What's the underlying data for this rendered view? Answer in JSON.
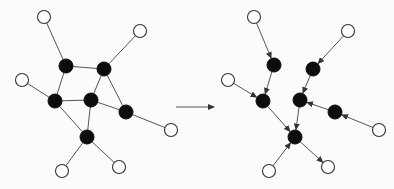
{
  "figure": {
    "colors": {
      "background": "#fbfbfb",
      "edge": "#555555",
      "internal_node": "#0d0d0d",
      "leaf_node_fill": "#ffffff",
      "leaf_node_stroke": "#333333"
    },
    "node_radius": {
      "internal": 7,
      "leaf": 6.5
    }
  },
  "left_graph": {
    "type": "undirected",
    "nodes": [
      {
        "id": "w_tl",
        "kind": "leaf",
        "x": 44,
        "y": 17
      },
      {
        "id": "w_tr",
        "kind": "leaf",
        "x": 140,
        "y": 31
      },
      {
        "id": "w_l",
        "kind": "leaf",
        "x": 22,
        "y": 80
      },
      {
        "id": "w_r",
        "kind": "leaf",
        "x": 171,
        "y": 130
      },
      {
        "id": "w_bl",
        "kind": "leaf",
        "x": 62,
        "y": 171
      },
      {
        "id": "w_br",
        "kind": "leaf",
        "x": 119,
        "y": 167
      },
      {
        "id": "A",
        "kind": "internal",
        "x": 66,
        "y": 66
      },
      {
        "id": "B",
        "kind": "internal",
        "x": 104,
        "y": 69
      },
      {
        "id": "C",
        "kind": "internal",
        "x": 55,
        "y": 101
      },
      {
        "id": "D",
        "kind": "internal",
        "x": 91,
        "y": 100
      },
      {
        "id": "E",
        "kind": "internal",
        "x": 126,
        "y": 112
      },
      {
        "id": "F",
        "kind": "internal",
        "x": 87,
        "y": 137
      }
    ],
    "edges": [
      [
        "w_tl",
        "A"
      ],
      [
        "A",
        "B"
      ],
      [
        "A",
        "C"
      ],
      [
        "B",
        "w_tr"
      ],
      [
        "B",
        "D"
      ],
      [
        "B",
        "E"
      ],
      [
        "C",
        "w_l"
      ],
      [
        "C",
        "D"
      ],
      [
        "C",
        "F"
      ],
      [
        "D",
        "E"
      ],
      [
        "D",
        "F"
      ],
      [
        "E",
        "w_r"
      ],
      [
        "F",
        "w_bl"
      ],
      [
        "F",
        "w_br"
      ]
    ]
  },
  "transform_arrow": {
    "x1": 176,
    "y1": 107,
    "x2": 214,
    "y2": 107
  },
  "right_graph": {
    "type": "directed",
    "nodes": [
      {
        "id": "w_tl",
        "kind": "leaf",
        "x": 254,
        "y": 17
      },
      {
        "id": "w_tr",
        "kind": "leaf",
        "x": 348,
        "y": 31
      },
      {
        "id": "w_l",
        "kind": "leaf",
        "x": 228,
        "y": 80
      },
      {
        "id": "w_r",
        "kind": "leaf",
        "x": 379,
        "y": 130
      },
      {
        "id": "w_bl",
        "kind": "leaf",
        "x": 269,
        "y": 171
      },
      {
        "id": "w_br",
        "kind": "leaf",
        "x": 328,
        "y": 167
      },
      {
        "id": "A",
        "kind": "internal",
        "x": 274,
        "y": 65
      },
      {
        "id": "B",
        "kind": "internal",
        "x": 313,
        "y": 69
      },
      {
        "id": "C",
        "kind": "internal",
        "x": 263,
        "y": 101
      },
      {
        "id": "D",
        "kind": "internal",
        "x": 300,
        "y": 100
      },
      {
        "id": "E",
        "kind": "internal",
        "x": 335,
        "y": 112
      },
      {
        "id": "F",
        "kind": "internal",
        "x": 295,
        "y": 137
      }
    ],
    "edges": [
      [
        "w_tl",
        "A"
      ],
      [
        "A",
        "C"
      ],
      [
        "w_l",
        "C"
      ],
      [
        "C",
        "F"
      ],
      [
        "w_tr",
        "B"
      ],
      [
        "B",
        "D"
      ],
      [
        "E",
        "D"
      ],
      [
        "w_r",
        "E"
      ],
      [
        "D",
        "F"
      ],
      [
        "w_bl",
        "F"
      ],
      [
        "F",
        "w_br"
      ]
    ]
  }
}
